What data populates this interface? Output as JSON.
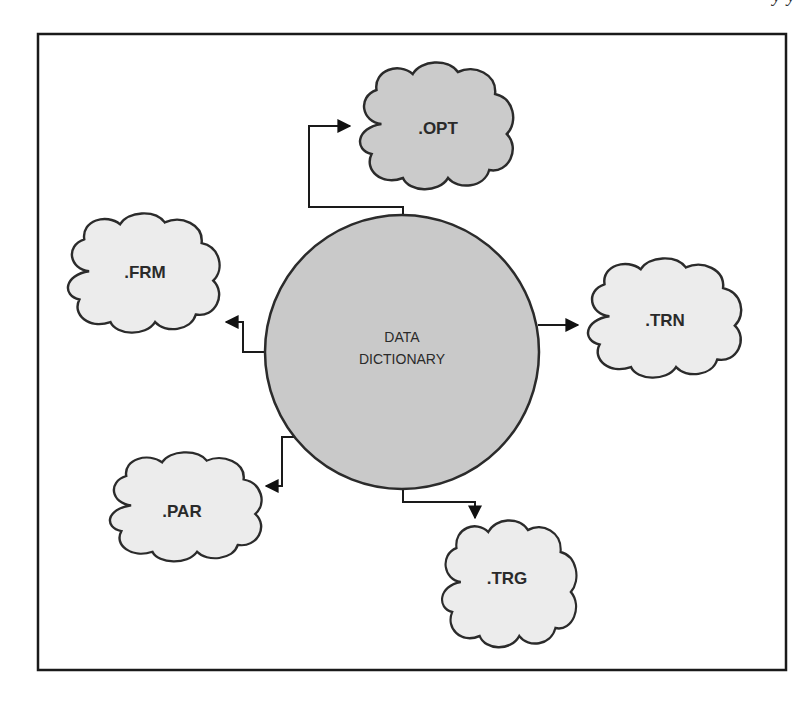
{
  "diagram": {
    "type": "hub-and-spoke",
    "colors": {
      "background": "#ffffff",
      "frame_stroke": "#1a1a1a",
      "hub_fill": "#c9c9c9",
      "dark_cloud_fill": "#cbcbcb",
      "light_cloud_fill": "#ececec",
      "stroke": "#2b2b2b",
      "text": "#2a2a2a"
    },
    "hub": {
      "label_line1": "DATA",
      "label_line2": "DICTIONARY"
    },
    "nodes": [
      {
        "id": "opt",
        "label": ".OPT",
        "shade": "dark",
        "position": "top"
      },
      {
        "id": "frm",
        "label": ".FRM",
        "shade": "light",
        "position": "left-upper"
      },
      {
        "id": "trn",
        "label": ".TRN",
        "shade": "light",
        "position": "right"
      },
      {
        "id": "par",
        "label": ".PAR",
        "shade": "light",
        "position": "left-lower"
      },
      {
        "id": "trg",
        "label": ".TRG",
        "shade": "light",
        "position": "bottom-right"
      }
    ],
    "edges": [
      {
        "from": "DATA DICTIONARY",
        "to": ".OPT",
        "directed": true
      },
      {
        "from": "DATA DICTIONARY",
        "to": ".FRM",
        "directed": true
      },
      {
        "from": "DATA DICTIONARY",
        "to": ".TRN",
        "directed": true
      },
      {
        "from": "DATA DICTIONARY",
        "to": ".PAR",
        "directed": true
      },
      {
        "from": "DATA DICTIONARY",
        "to": ".TRG",
        "directed": true
      }
    ]
  },
  "page_fragment": {
    "top_cut_text": "y        y"
  }
}
